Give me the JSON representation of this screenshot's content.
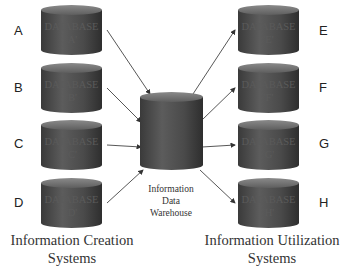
{
  "diagram": {
    "title": "",
    "creation_systems": [
      {
        "letter": "A",
        "label_line1": "DATABASE",
        "label_line2": "'A'"
      },
      {
        "letter": "B",
        "label_line1": "DATABASE",
        "label_line2": "'B'"
      },
      {
        "letter": "C",
        "label_line1": "DATABASE",
        "label_line2": "'C'"
      },
      {
        "letter": "D",
        "label_line1": "DATABASE",
        "label_line2": "'D'"
      }
    ],
    "utilization_systems": [
      {
        "letter": "E",
        "label_line1": "DATABASE",
        "label_line2": "'E'"
      },
      {
        "letter": "F",
        "label_line1": "DATABASE",
        "label_line2": "'F'"
      },
      {
        "letter": "G",
        "label_line1": "DATABASE",
        "label_line2": "'G'"
      },
      {
        "letter": "H",
        "label_line1": "DATABASE",
        "label_line2": "'H'"
      }
    ],
    "warehouse": {
      "line1": "Information",
      "line2": "Data",
      "line3": "Warehouse"
    },
    "captions": {
      "left_line1": "Information Creation",
      "left_line2": "Systems",
      "right_line1": "Information Utilization",
      "right_line2": "Systems"
    },
    "edges": [
      {
        "from": "A",
        "to": "warehouse"
      },
      {
        "from": "B",
        "to": "warehouse"
      },
      {
        "from": "C",
        "to": "warehouse"
      },
      {
        "from": "D",
        "to": "warehouse"
      },
      {
        "from": "warehouse",
        "to": "E"
      },
      {
        "from": "warehouse",
        "to": "F"
      },
      {
        "from": "warehouse",
        "to": "G"
      },
      {
        "from": "warehouse",
        "to": "H"
      }
    ]
  }
}
